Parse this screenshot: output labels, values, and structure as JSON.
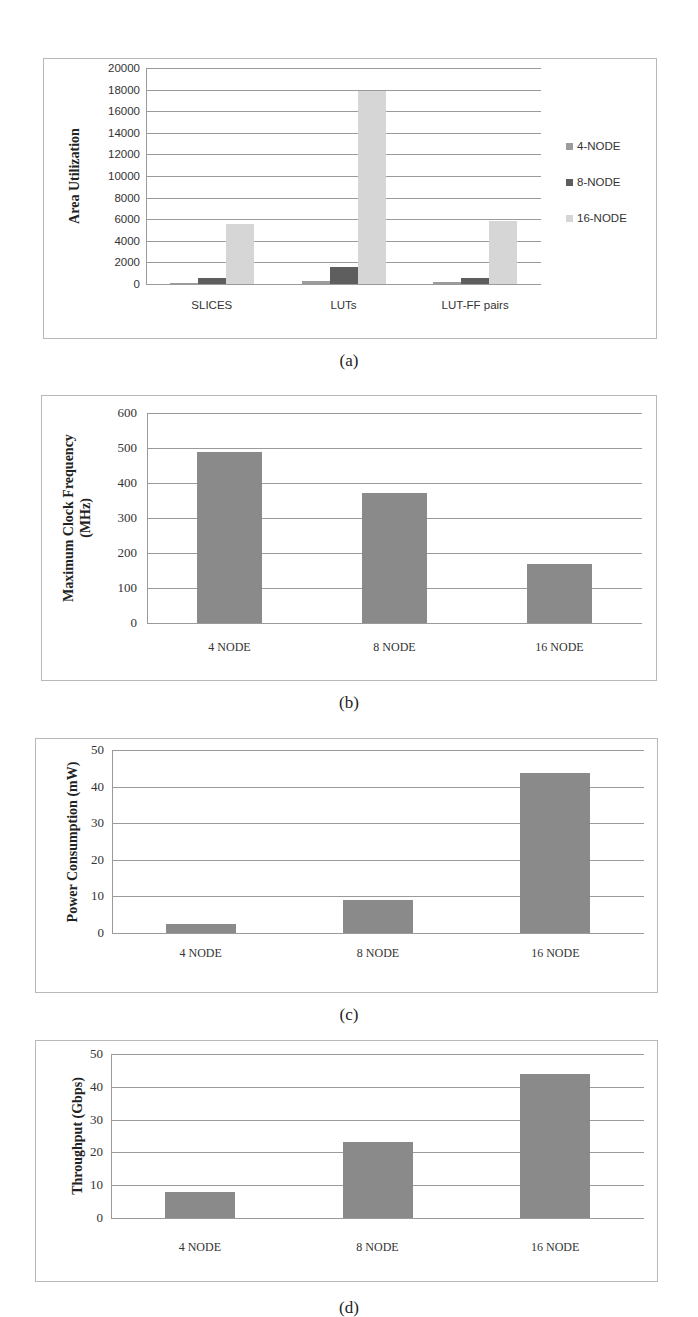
{
  "chart_data": [
    {
      "id": "a",
      "type": "bar",
      "caption": "(a)",
      "title": "",
      "xlabel": "",
      "ylabel": "Area Utilization",
      "categories": [
        "SLICES",
        "LUTs",
        "LUT-FF pairs"
      ],
      "series": [
        {
          "name": "4-NODE",
          "color": "#9c9c9c",
          "values": [
            120,
            280,
            215
          ]
        },
        {
          "name": "8-NODE",
          "color": "#5e5e5e",
          "values": [
            520,
            1550,
            590
          ]
        },
        {
          "name": "16-NODE",
          "color": "#d6d6d6",
          "values": [
            5600,
            17900,
            5850
          ]
        }
      ],
      "yticks": [
        "20000",
        "18000",
        "16000",
        "14000",
        "12000",
        "10000",
        "8000",
        "6000",
        "4000",
        "2000",
        "0"
      ],
      "ylim": [
        0,
        20000
      ],
      "grid": true,
      "legend_position": "right"
    },
    {
      "id": "b",
      "type": "bar",
      "caption": "(b)",
      "title": "",
      "xlabel": "",
      "ylabel": "Maximum Clock Frequency (MHz)",
      "ylabel_lines": [
        "Maximum Clock Frequency",
        "(MHz)"
      ],
      "categories": [
        "4 NODE",
        "8 NODE",
        "16 NODE"
      ],
      "values": [
        488,
        372,
        169
      ],
      "color": "#8a8a8a",
      "yticks": [
        "600",
        "500",
        "400",
        "300",
        "200",
        "100",
        "0"
      ],
      "ylim": [
        0,
        600
      ],
      "grid": true
    },
    {
      "id": "c",
      "type": "bar",
      "caption": "(c)",
      "title": "",
      "xlabel": "",
      "ylabel": "Power Consumption (mW)",
      "categories": [
        "4 NODE",
        "8 NODE",
        "16 NODE"
      ],
      "values": [
        2.4,
        9.0,
        43.6
      ],
      "color": "#8a8a8a",
      "yticks": [
        "50",
        "40",
        "30",
        "20",
        "10",
        "0"
      ],
      "ylim": [
        0,
        50
      ],
      "grid": true
    },
    {
      "id": "d",
      "type": "bar",
      "caption": "(d)",
      "title": "",
      "xlabel": "",
      "ylabel": "Throughput (Gbps)",
      "categories": [
        "4 NODE",
        "8 NODE",
        "16 NODE"
      ],
      "values": [
        7.9,
        23.3,
        43.8
      ],
      "color": "#8a8a8a",
      "yticks": [
        "50",
        "40",
        "30",
        "20",
        "10",
        "0"
      ],
      "ylim": [
        0,
        50
      ],
      "grid": true
    }
  ]
}
